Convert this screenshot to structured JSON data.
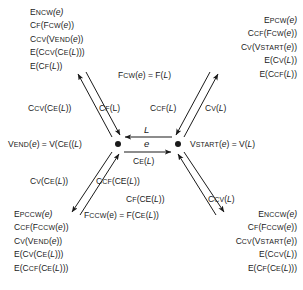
{
  "diagram": {
    "nodes": [
      {
        "id": "left-node",
        "label": "V_END(e) = V(C_E((L)"
      },
      {
        "id": "right-node",
        "label": "V_START(e) = V(L)"
      }
    ],
    "center": {
      "top_arrow_label": "L",
      "middle_label": "e",
      "bottom_arrow_label": "C_E(L)",
      "top_arrow_direction": "left",
      "bottom_arrow_direction": "right"
    },
    "left_label": {
      "v": "V",
      "end": "END",
      "e_arg": "(e) = V(C",
      "sub_e": "E",
      "tail": "((L)"
    },
    "right_label": {
      "v": "V",
      "start": "START",
      "tail": "(e) = V(L)"
    },
    "corner_blocks": {
      "top_left": [
        {
          "head": "E",
          "sub": "NCW",
          "tail": "(e)"
        },
        {
          "head": "C",
          "sub": "F",
          "tail": "(F",
          "sub2": "CW",
          "tail2": "(e))"
        },
        {
          "head": "C",
          "sub": "CV",
          "tail": "(V",
          "sub2": "END",
          "tail2": "(e))"
        },
        {
          "head": "E(C",
          "sub": "CV",
          "tail": "(C",
          "sub2": "E",
          "tail2": "(L)))"
        },
        {
          "head": "E(C",
          "sub": "F",
          "tail": "(L))"
        }
      ],
      "top_right": [
        {
          "head": "E",
          "sub": "PCW",
          "tail": "(e)"
        },
        {
          "head": "C",
          "sub": "CF",
          "tail": "(F",
          "sub2": "CW",
          "tail2": "(e))"
        },
        {
          "head": "C",
          "sub": "V",
          "tail": "(V",
          "sub2": "START",
          "tail2": "(e))"
        },
        {
          "head": "E(C",
          "sub": "V",
          "tail": "(L))"
        },
        {
          "head": "E(C",
          "sub": "CF",
          "tail": "(L))"
        }
      ],
      "bottom_left": [
        {
          "head": "E",
          "sub": "PCCW",
          "tail": "(e)"
        },
        {
          "head": "C",
          "sub": "CF",
          "tail": "(F",
          "sub2": "CCW",
          "tail2": "(e))"
        },
        {
          "head": "C",
          "sub": "V",
          "tail": "(V",
          "sub2": "END",
          "tail2": "(e))"
        },
        {
          "head": "E(C",
          "sub": "V",
          "tail": "(C",
          "sub2": "E",
          "tail2": "(L)))"
        },
        {
          "head": "E(C",
          "sub": "CF",
          "tail": "(C",
          "sub2": "E",
          "tail2": "(L)))"
        }
      ],
      "bottom_right": [
        {
          "head": "E",
          "sub": "NCCW",
          "tail": "(e)"
        },
        {
          "head": "C",
          "sub": "F",
          "tail": "(F",
          "sub2": "CCW",
          "tail2": "(e))"
        },
        {
          "head": "C",
          "sub": "CV",
          "tail": "(V",
          "sub2": "START",
          "tail2": "(e))"
        },
        {
          "head": "E(C",
          "sub": "CV",
          "tail": "(L))"
        },
        {
          "head": "E(C",
          "sub": "F",
          "tail": "(C",
          "sub2": "E",
          "tail2": "(L)))"
        }
      ]
    },
    "edge_labels": {
      "fcw_relation": {
        "head": "F",
        "sub": "CW",
        "tail": "(e) = F(L)"
      },
      "fccw_relation": {
        "head": "F",
        "sub": "CCW",
        "tail": "(e) = F(C",
        "sub2": "E",
        "tail2": "(L))"
      },
      "ccv_ce_l": {
        "head": "C",
        "sub": "CV",
        "tail": "(C",
        "sub2": "E",
        "tail2": "(L))"
      },
      "cf_l": {
        "head": "C",
        "sub": "F",
        "tail": "(L)"
      },
      "ccf_l": {
        "head": "C",
        "sub": "CF",
        "tail": "(L)"
      },
      "cv_l": {
        "head": "C",
        "sub": "V",
        "tail": "(L)"
      },
      "cv_ce_l": {
        "head": "C",
        "sub": "V",
        "tail": "(C",
        "sub2": "E",
        "tail2": "(L))"
      },
      "ccf_ce_l": {
        "head": "C",
        "sub": "CF",
        "tail": "(CE(L))"
      },
      "cf_ce_l": {
        "head": "C",
        "sub": "F",
        "tail": "(CE(L))"
      },
      "ccv_l": {
        "head": "C",
        "sub": "CV",
        "tail": "(L)"
      }
    },
    "colors": {
      "ink": "#1a1a1a",
      "background": "#ffffff"
    }
  }
}
